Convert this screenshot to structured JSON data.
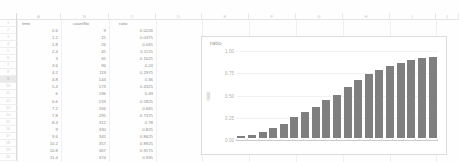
{
  "app": {
    "type": "spreadsheet"
  },
  "sheet": {
    "column_headers": [
      "A",
      "B",
      "C",
      "D",
      "E",
      "F",
      "G",
      "H",
      "I",
      "J"
    ],
    "header_row": {
      "row_number": "1",
      "time": "time",
      "countNo": "countNo",
      "ratio": "ratio"
    },
    "selected_row": "9",
    "columns": [
      "time",
      "countNo",
      "ratio"
    ],
    "rows": [
      {
        "n": "2",
        "time": "0.6",
        "countNo": "9",
        "ratio": "0.0226"
      },
      {
        "n": "3",
        "time": "1.2",
        "countNo": "15",
        "ratio": "0.0375"
      },
      {
        "n": "4",
        "time": "1.8",
        "countNo": "26",
        "ratio": "0.065"
      },
      {
        "n": "5",
        "time": "2.4",
        "countNo": "45",
        "ratio": "0.1125"
      },
      {
        "n": "6",
        "time": "3",
        "countNo": "65",
        "ratio": "0.1625"
      },
      {
        "n": "7",
        "time": "3.6",
        "countNo": "96",
        "ratio": "0.24"
      },
      {
        "n": "8",
        "time": "4.2",
        "countNo": "119",
        "ratio": "0.2975"
      },
      {
        "n": "9",
        "time": "4.8",
        "countNo": "144",
        "ratio": "0.36"
      },
      {
        "n": "10",
        "time": "5.4",
        "countNo": "173",
        "ratio": "0.4325"
      },
      {
        "n": "11",
        "time": "6",
        "countNo": "196",
        "ratio": "0.49"
      },
      {
        "n": "12",
        "time": "6.6",
        "countNo": "233",
        "ratio": "0.5825"
      },
      {
        "n": "13",
        "time": "7.2",
        "countNo": "266",
        "ratio": "0.665"
      },
      {
        "n": "14",
        "time": "7.8",
        "countNo": "295",
        "ratio": "0.7375"
      },
      {
        "n": "15",
        "time": "8.4",
        "countNo": "312",
        "ratio": "0.78"
      },
      {
        "n": "16",
        "time": "9",
        "countNo": "330",
        "ratio": "0.825"
      },
      {
        "n": "17",
        "time": "9.6",
        "countNo": "345",
        "ratio": "0.8625"
      },
      {
        "n": "18",
        "time": "10.2",
        "countNo": "357",
        "ratio": "0.8925"
      },
      {
        "n": "19",
        "time": "10.8",
        "countNo": "367",
        "ratio": "0.9175"
      },
      {
        "n": "20",
        "time": "11.4",
        "countNo": "374",
        "ratio": "0.935"
      }
    ]
  },
  "chart_data": {
    "type": "bar",
    "title": "ratio",
    "xlabel": "",
    "ylabel": "ratio",
    "ylim": [
      0,
      1.0
    ],
    "grid": true,
    "legend": false,
    "bar_color": "#7f7f7f",
    "ytick_labels": [
      "1.00",
      "0.75",
      "0.50",
      "0.25",
      "0.00"
    ],
    "ytick_values": [
      1.0,
      0.75,
      0.5,
      0.25,
      0.0
    ],
    "categories": [
      "0.6",
      "1.2",
      "1.8",
      "2.4",
      "3",
      "3.6",
      "4.2",
      "4.8",
      "5.4",
      "6",
      "6.6",
      "7.2",
      "7.8",
      "8.4",
      "9",
      "9.6",
      "10.2",
      "10.8",
      "11.4"
    ],
    "values": [
      0.0226,
      0.0375,
      0.065,
      0.1125,
      0.1625,
      0.24,
      0.2975,
      0.36,
      0.4325,
      0.49,
      0.5825,
      0.665,
      0.7375,
      0.78,
      0.825,
      0.8625,
      0.8925,
      0.9175,
      0.935
    ]
  }
}
